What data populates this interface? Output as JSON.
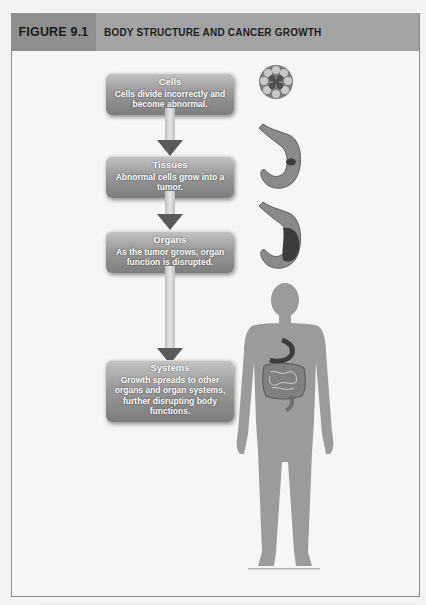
{
  "figure": {
    "label": "FIGURE 9.1",
    "title": "BODY STRUCTURE AND CANCER GROWTH"
  },
  "steps": [
    {
      "title": "Cells",
      "text": "Cells divide incorrectly and become abnormal."
    },
    {
      "title": "Tissues",
      "text": "Abnormal cells grow into a tumor."
    },
    {
      "title": "Organs",
      "text": "As the tumor grows, organ function is disrupted."
    },
    {
      "title": "Systems",
      "text": "Growth spreads to other organs and organ systems, further disrupting body functions."
    }
  ],
  "illustrations": {
    "cells": "abnormal-cell-cluster",
    "tissues": "stomach-with-small-tumor",
    "organs": "stomach-with-large-tumor",
    "systems": "human-body-with-digestive-system"
  },
  "colors": {
    "header_bg": "#a3a3a3",
    "label_bg": "#8f8f8f",
    "box_dark": "#7d7d7d",
    "arrow": "#5a5a5a"
  }
}
